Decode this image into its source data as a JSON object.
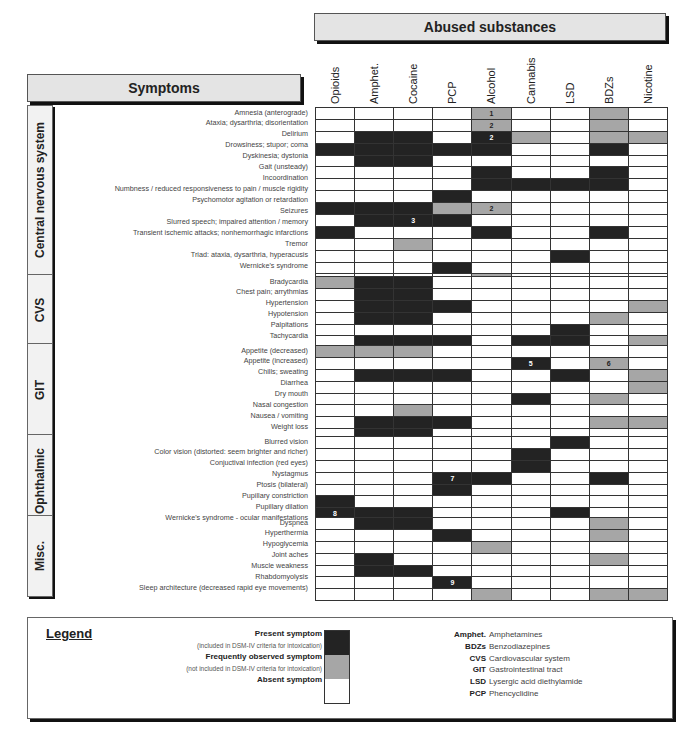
{
  "header": {
    "substances_title": "Abused substances",
    "symptoms_title": "Symptoms"
  },
  "columns": [
    "Opioids",
    "Amphet.",
    "Cocaine",
    "PCP",
    "Alcohol",
    "Cannabis",
    "LSD",
    "BDZs",
    "Nicotine"
  ],
  "colors": {
    "present": "#232323",
    "frequent": "#a6a6a6",
    "absent": "#ffffff"
  },
  "sections": [
    {
      "name": "Central nervous system",
      "rows": [
        {
          "label": "Amnesia (anterograde)",
          "cells": [
            "W",
            "W",
            "W",
            "W",
            "G:1",
            "W",
            "W",
            "G",
            "W"
          ]
        },
        {
          "label": "Ataxia; dysarthria; disorientation",
          "cells": [
            "W",
            "W",
            "W",
            "W",
            "G:2",
            "W",
            "W",
            "G",
            "W"
          ]
        },
        {
          "label": "Delirium",
          "cells": [
            "W",
            "D",
            "D",
            "W",
            "D:2",
            "G",
            "W",
            "G",
            "G"
          ]
        },
        {
          "label": "Drowsiness; stupor; coma",
          "cells": [
            "D",
            "D",
            "D",
            "D",
            "D",
            "W",
            "W",
            "D",
            "W"
          ]
        },
        {
          "label": "Dyskinesia; dystonia",
          "cells": [
            "W",
            "D",
            "D",
            "W",
            "W",
            "W",
            "W",
            "W",
            "W"
          ]
        },
        {
          "label": "Gait (unsteady)",
          "cells": [
            "W",
            "W",
            "W",
            "W",
            "D",
            "W",
            "W",
            "D",
            "W"
          ]
        },
        {
          "label": "Incoordination",
          "cells": [
            "W",
            "W",
            "W",
            "W",
            "D",
            "D",
            "D",
            "D",
            "W"
          ]
        },
        {
          "label": "Numbness / reduced responsiveness to pain / muscle rigidity",
          "cells": [
            "W",
            "W",
            "W",
            "D",
            "W",
            "W",
            "W",
            "W",
            "W"
          ]
        },
        {
          "label": "Psychomotor agitation or retardation",
          "cells": [
            "D",
            "D",
            "D",
            "G",
            "G:2",
            "W",
            "W",
            "W",
            "W"
          ]
        },
        {
          "label": "Seizures",
          "cells": [
            "W",
            "D",
            "D:3",
            "D",
            "W",
            "W",
            "W",
            "W",
            "W"
          ]
        },
        {
          "label": "Slurred speech; impaired attention / memory",
          "cells": [
            "D",
            "W",
            "W",
            "W",
            "D",
            "W",
            "W",
            "D",
            "W"
          ]
        },
        {
          "label": "Transient ischemic attacks; nonhemorrhagic infarctions",
          "cells": [
            "W",
            "W",
            "G",
            "W",
            "W",
            "W",
            "W",
            "W",
            "W"
          ]
        },
        {
          "label": "Tremor",
          "cells": [
            "W",
            "W",
            "W",
            "W",
            "W",
            "W",
            "D",
            "W",
            "W"
          ]
        },
        {
          "label": "Triad:  ataxia, dysarthria, hyperacusis",
          "cells": [
            "W",
            "W",
            "W",
            "D",
            "W",
            "W",
            "W",
            "W",
            "W"
          ]
        },
        {
          "label": "Wernicke's  syndrome",
          "cells": [
            "W",
            "W",
            "W",
            "W",
            "G:4",
            "W",
            "W",
            "W",
            "W"
          ]
        }
      ]
    },
    {
      "name": "CVS",
      "rows": [
        {
          "label": "Bradycardia",
          "cells": [
            "G",
            "D",
            "D",
            "W",
            "W",
            "W",
            "W",
            "W",
            "W"
          ]
        },
        {
          "label": "Chest pain; arrythmias",
          "cells": [
            "W",
            "D",
            "D",
            "W",
            "W",
            "W",
            "W",
            "W",
            "W"
          ]
        },
        {
          "label": "Hypertension",
          "cells": [
            "W",
            "D",
            "D",
            "D",
            "W",
            "W",
            "W",
            "W",
            "G"
          ]
        },
        {
          "label": "Hypotension",
          "cells": [
            "W",
            "D",
            "D",
            "W",
            "W",
            "W",
            "W",
            "G",
            "W"
          ]
        },
        {
          "label": "Palpitations",
          "cells": [
            "W",
            "W",
            "W",
            "W",
            "W",
            "W",
            "D",
            "W",
            "W"
          ]
        },
        {
          "label": "Tachycardia",
          "cells": [
            "W",
            "D",
            "D",
            "D",
            "W",
            "D",
            "D",
            "W",
            "G"
          ]
        }
      ]
    },
    {
      "name": "GIT",
      "rows": [
        {
          "label": "Appetite (decreased)",
          "cells": [
            "G",
            "G",
            "G",
            "W",
            "W",
            "W",
            "W",
            "W",
            "W"
          ]
        },
        {
          "label": "Appetite (increased)",
          "cells": [
            "W",
            "W",
            "W",
            "W",
            "W",
            "D:5",
            "W",
            "G:6",
            "W"
          ]
        },
        {
          "label": "Chills; sweating",
          "cells": [
            "W",
            "D",
            "D",
            "D",
            "W",
            "W",
            "D",
            "W",
            "G"
          ]
        },
        {
          "label": "Diarrhea",
          "cells": [
            "W",
            "W",
            "W",
            "W",
            "W",
            "W",
            "W",
            "W",
            "G"
          ]
        },
        {
          "label": "Dry mouth",
          "cells": [
            "W",
            "W",
            "W",
            "W",
            "W",
            "D",
            "W",
            "G",
            "W"
          ]
        },
        {
          "label": "Nasal congestion",
          "cells": [
            "W",
            "W",
            "G",
            "W",
            "W",
            "W",
            "W",
            "W",
            "W"
          ]
        },
        {
          "label": "Nausea / vomiting",
          "cells": [
            "W",
            "D",
            "D",
            "D",
            "W",
            "W",
            "W",
            "G",
            "G"
          ]
        },
        {
          "label": "Weight loss",
          "cells": [
            "W",
            "D",
            "D",
            "W",
            "W",
            "W",
            "W",
            "W",
            "W"
          ]
        }
      ]
    },
    {
      "name": "Ophthalmic",
      "rows": [
        {
          "label": "Blurred vision",
          "cells": [
            "W",
            "W",
            "W",
            "W",
            "W",
            "W",
            "D",
            "W",
            "W"
          ]
        },
        {
          "label": "Color vision (distorted: seem brighter and richer)",
          "cells": [
            "W",
            "W",
            "W",
            "W",
            "W",
            "D",
            "W",
            "W",
            "W"
          ]
        },
        {
          "label": "Conjuctival infection (red eyes)",
          "cells": [
            "W",
            "W",
            "W",
            "W",
            "W",
            "D",
            "W",
            "W",
            "W"
          ]
        },
        {
          "label": "Nystagmus",
          "cells": [
            "W",
            "W",
            "W",
            "D:7",
            "D",
            "W",
            "W",
            "D",
            "W"
          ]
        },
        {
          "label": "Ptosis (bilateral)",
          "cells": [
            "W",
            "W",
            "W",
            "D",
            "W",
            "W",
            "W",
            "W",
            "W"
          ]
        },
        {
          "label": "Pupillary constriction",
          "cells": [
            "D",
            "W",
            "W",
            "W",
            "W",
            "W",
            "W",
            "W",
            "W"
          ]
        },
        {
          "label": "Pupillary dilation",
          "cells": [
            "D:8",
            "D",
            "D",
            "W",
            "W",
            "W",
            "D",
            "W",
            "W"
          ]
        },
        {
          "label": "Wernicke's syndrome - ocular  manifestations",
          "cells": [
            "W",
            "W",
            "W",
            "W",
            "G:4",
            "W",
            "W",
            "W",
            "W"
          ]
        }
      ]
    },
    {
      "name": "Misc.",
      "rows": [
        {
          "label": "Dyspnea",
          "cells": [
            "W",
            "D",
            "D",
            "W",
            "W",
            "W",
            "W",
            "G",
            "W"
          ]
        },
        {
          "label": "Hyperthermia",
          "cells": [
            "W",
            "W",
            "W",
            "D",
            "W",
            "W",
            "W",
            "G",
            "W"
          ]
        },
        {
          "label": "Hypoglycemia",
          "cells": [
            "W",
            "W",
            "W",
            "W",
            "G",
            "W",
            "W",
            "W",
            "W"
          ]
        },
        {
          "label": "Joint aches",
          "cells": [
            "W",
            "D",
            "W",
            "W",
            "W",
            "W",
            "W",
            "G",
            "W"
          ]
        },
        {
          "label": "Muscle weakness",
          "cells": [
            "W",
            "D",
            "D",
            "W",
            "W",
            "W",
            "W",
            "W",
            "W"
          ]
        },
        {
          "label": "Rhabdomyolysis",
          "cells": [
            "W",
            "W",
            "W",
            "D:9",
            "W",
            "W",
            "W",
            "W",
            "W"
          ]
        },
        {
          "label": "Sleep architecture (decreased rapid eye movements)",
          "cells": [
            "W",
            "W",
            "W",
            "W",
            "G",
            "W",
            "W",
            "G",
            "G"
          ]
        }
      ]
    }
  ],
  "legend": {
    "title": "Legend",
    "items": [
      {
        "label": "Present symptom",
        "note": "(included in DSM-IV criteria for intoxication)",
        "key": "present"
      },
      {
        "label": "Frequently observed symptom",
        "note": "(not included in DSM-IV criteria for intoxication)",
        "key": "frequent"
      },
      {
        "label": "Absent symptom",
        "note": "",
        "key": "absent"
      }
    ],
    "abbreviations": [
      {
        "abbr": "Amphet.",
        "full": "Amphetamines"
      },
      {
        "abbr": "BDZs",
        "full": "Benzodiazepines"
      },
      {
        "abbr": "CVS",
        "full": "Cardiovascular system"
      },
      {
        "abbr": "GIT",
        "full": "Gastrointestinal tract"
      },
      {
        "abbr": "LSD",
        "full": "Lysergic acid diethylamide"
      },
      {
        "abbr": "PCP",
        "full": "Phencyclidine"
      }
    ]
  }
}
